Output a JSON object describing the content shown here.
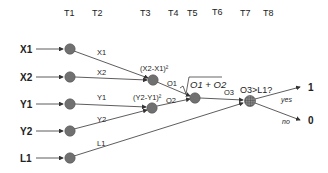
{
  "time_steps": [
    "T1",
    "T2",
    "T3",
    "T4",
    "T5",
    "T6",
    "T7",
    "T8"
  ],
  "inputs": [
    "X1",
    "X2",
    "Y1",
    "Y2",
    "L1"
  ],
  "edge_labels": {
    "x1": "X1",
    "x2": "X2",
    "y1": "Y1",
    "y2": "Y2",
    "l1": "L1",
    "o1": "O1",
    "o2": "O2",
    "o3": "O3",
    "yes": "yes",
    "no": "no"
  },
  "formulas": {
    "dx": "(X2-X1)²",
    "dy": "(Y2-Y1)²",
    "sqrt": "O1 + O2",
    "compare": "O3>L1?"
  },
  "outputs": [
    "1",
    "0"
  ],
  "colors": {
    "node": "#707070",
    "edge": "#333333"
  }
}
